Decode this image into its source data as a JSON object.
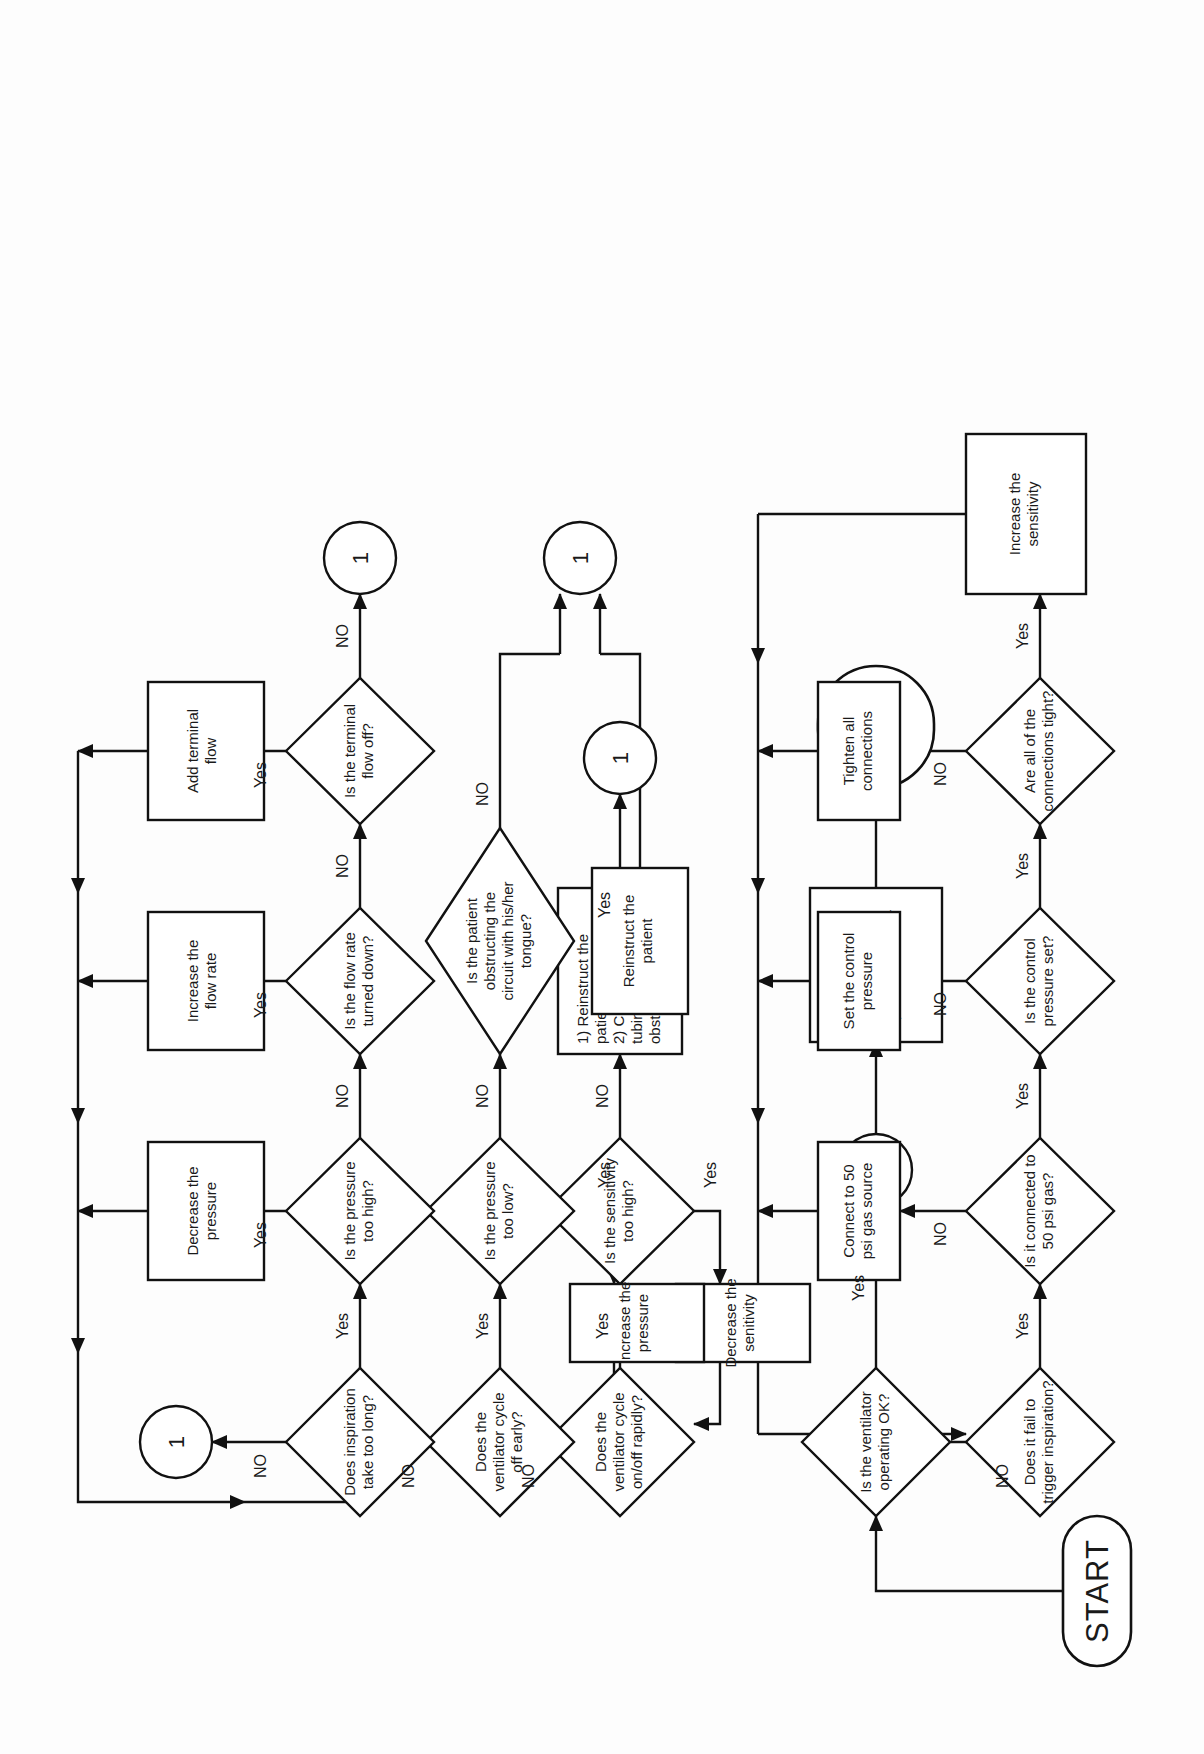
{
  "diagram": {
    "title_terminals": {
      "start": "START",
      "end": "END"
    },
    "connector_label": "1",
    "labels": {
      "yes": "Yes",
      "no": "NO"
    },
    "nodes": [
      {
        "id": "start",
        "type": "terminal",
        "text": "START"
      },
      {
        "id": "vent_ok",
        "type": "decision",
        "text": "Is the ventilator\noperating OK?"
      },
      {
        "id": "conn_top",
        "type": "connector",
        "text": "1"
      },
      {
        "id": "continue",
        "type": "process",
        "text": "Continue to\nmonitor the\npatient/ventilator"
      },
      {
        "id": "end",
        "type": "terminal",
        "text": "END"
      },
      {
        "id": "insp_long",
        "type": "decision",
        "text": "Does inspiration\ntake too long?"
      },
      {
        "id": "press_high",
        "type": "decision",
        "text": "Is the pressure\ntoo high?"
      },
      {
        "id": "flow_down",
        "type": "decision",
        "text": "Is the flow rate\nturned down?"
      },
      {
        "id": "term_off",
        "type": "decision",
        "text": "Is the terminal\nflow off?"
      },
      {
        "id": "dec_press",
        "type": "process",
        "text": "Decrease the\npressure"
      },
      {
        "id": "inc_flow",
        "type": "process",
        "text": "Increase the\nflow rate"
      },
      {
        "id": "add_term",
        "type": "process",
        "text": "Add terminal\nflow"
      },
      {
        "id": "conn_insp",
        "type": "connector",
        "text": "1"
      },
      {
        "id": "conn_term",
        "type": "connector",
        "text": "1"
      },
      {
        "id": "cycle_early",
        "type": "decision",
        "text": "Does the\nventilator cycle\noff early?"
      },
      {
        "id": "press_low",
        "type": "decision",
        "text": "Is the pressure\ntoo low?"
      },
      {
        "id": "obstruct",
        "type": "decision",
        "text": "Is the patient\nobstructing the\ncircuit with his/her\ntongue?"
      },
      {
        "id": "inc_press",
        "type": "process",
        "text": "Increase the\npressure"
      },
      {
        "id": "reinstruct",
        "type": "process",
        "text": "Reinstruct the\npatient"
      },
      {
        "id": "conn_obst",
        "type": "connector",
        "text": "1"
      },
      {
        "id": "cycle_rapid",
        "type": "decision",
        "text": "Does the\nventilator cycle\non/off rapidly?"
      },
      {
        "id": "sens_high",
        "type": "decision",
        "text": "Is the sensitivity\ntoo high?"
      },
      {
        "id": "dec_sens",
        "type": "process",
        "text": "Decrease the\nsenitivity"
      },
      {
        "id": "reinstruct2",
        "type": "process",
        "text": "1) Reinstruct the\npatient\n2) Check for\ntubing\nobstructions"
      },
      {
        "id": "conn_sens",
        "type": "connector",
        "text": "1"
      },
      {
        "id": "trigger",
        "type": "decision",
        "text": "Does it fail to\ntrigger inspiration?"
      },
      {
        "id": "gas50",
        "type": "decision",
        "text": "Is it connected to\n50 psi gas?"
      },
      {
        "id": "ctrl_press",
        "type": "decision",
        "text": "Is the control\npressure set?"
      },
      {
        "id": "conns_tight",
        "type": "decision",
        "text": "Are all of the\nconnections tight?"
      },
      {
        "id": "connect50",
        "type": "process",
        "text": "Connect to 50\npsi gas source"
      },
      {
        "id": "set_press",
        "type": "process",
        "text": "Set the control\npressure"
      },
      {
        "id": "tighten",
        "type": "process",
        "text": "Tighten all\nconnections"
      },
      {
        "id": "inc_sens",
        "type": "process",
        "text": "Increase the\nsensitivity"
      }
    ],
    "edges": [
      {
        "from": "start",
        "to": "vent_ok",
        "label": ""
      },
      {
        "from": "vent_ok",
        "to": "conn_top",
        "label": "Yes"
      },
      {
        "from": "vent_ok",
        "to": "trigger",
        "label": "NO"
      },
      {
        "from": "conn_top",
        "to": "continue",
        "label": ""
      },
      {
        "from": "continue",
        "to": "end",
        "label": ""
      },
      {
        "from": "insp_long",
        "to": "conn_insp",
        "label": "NO"
      },
      {
        "from": "insp_long",
        "to": "press_high",
        "label": "Yes"
      },
      {
        "from": "press_high",
        "to": "dec_press",
        "label": "Yes"
      },
      {
        "from": "press_high",
        "to": "flow_down",
        "label": "NO"
      },
      {
        "from": "flow_down",
        "to": "inc_flow",
        "label": "Yes"
      },
      {
        "from": "flow_down",
        "to": "term_off",
        "label": "NO"
      },
      {
        "from": "term_off",
        "to": "add_term",
        "label": "Yes"
      },
      {
        "from": "term_off",
        "to": "conn_term",
        "label": "NO"
      },
      {
        "from": "cycle_early",
        "to": "insp_long",
        "label": "NO"
      },
      {
        "from": "cycle_early",
        "to": "press_low",
        "label": "Yes"
      },
      {
        "from": "press_low",
        "to": "inc_press",
        "label": "Yes"
      },
      {
        "from": "press_low",
        "to": "obstruct",
        "label": "NO"
      },
      {
        "from": "obstruct",
        "to": "reinstruct",
        "label": "Yes"
      },
      {
        "from": "obstruct",
        "to": "conn_obst",
        "label": "NO"
      },
      {
        "from": "cycle_rapid",
        "to": "cycle_early",
        "label": "NO"
      },
      {
        "from": "cycle_rapid",
        "to": "sens_high",
        "label": "Yes"
      },
      {
        "from": "sens_high",
        "to": "dec_sens",
        "label": "Yes"
      },
      {
        "from": "sens_high",
        "to": "reinstruct2",
        "label": "NO"
      },
      {
        "from": "reinstruct2",
        "to": "conn_sens",
        "label": ""
      },
      {
        "from": "trigger",
        "to": "gas50",
        "label": "Yes"
      },
      {
        "from": "gas50",
        "to": "connect50",
        "label": "NO"
      },
      {
        "from": "gas50",
        "to": "ctrl_press",
        "label": "Yes"
      },
      {
        "from": "ctrl_press",
        "to": "set_press",
        "label": "NO"
      },
      {
        "from": "ctrl_press",
        "to": "conns_tight",
        "label": "Yes"
      },
      {
        "from": "conns_tight",
        "to": "tighten",
        "label": "NO"
      },
      {
        "from": "conns_tight",
        "to": "inc_sens",
        "label": "Yes"
      }
    ]
  }
}
